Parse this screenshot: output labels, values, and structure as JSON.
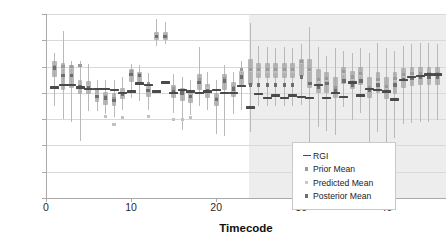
{
  "chart_data": {
    "type": "scatter",
    "title": "",
    "xlabel": "Timecode",
    "ylabel": "Ash (%)",
    "xlim": [
      0,
      47
    ],
    "ylim": [
      2,
      16
    ],
    "xticks": [
      0,
      10,
      20,
      30,
      40
    ],
    "yticks": [
      2,
      4,
      6,
      8,
      10,
      12,
      14,
      16
    ],
    "grid": true,
    "legend_position": "inside-bottom-right",
    "legend": [
      {
        "label": "RGI",
        "marker": "dash",
        "color": "#4a4a4a"
      },
      {
        "label": "Prior Mean",
        "marker": "square",
        "color": "#9a9a9a"
      },
      {
        "label": "Predicted Mean",
        "marker": "square",
        "color": "#c9c9c9"
      },
      {
        "label": "Posterior Mean",
        "marker": "square",
        "color": "#6e6e6e"
      }
    ],
    "annotations": [
      {
        "type": "shaded-region",
        "label": "forecast region",
        "x_start": 23.8,
        "x_end": 47,
        "color": "#e6e6e6"
      }
    ],
    "x": [
      1,
      2,
      3,
      4,
      5,
      6,
      7,
      8,
      9,
      10,
      11,
      12,
      13,
      14,
      15,
      16,
      17,
      18,
      19,
      20,
      21,
      22,
      23,
      24,
      25,
      26,
      27,
      28,
      29,
      30,
      31,
      32,
      33,
      34,
      35,
      36,
      37,
      38,
      39,
      40,
      41,
      42,
      43,
      44,
      45,
      46
    ],
    "series": [
      {
        "name": "RGI",
        "values": [
          10.4,
          10.6,
          10.6,
          10.4,
          10.3,
          10.3,
          10.3,
          10.2,
          10.0,
          10.1,
          10.7,
          10.6,
          10.1,
          10.8,
          10.0,
          10.2,
          10.1,
          10.0,
          10.1,
          10.2,
          10.0,
          10.0,
          10.5,
          8.9,
          9.9,
          9.6,
          9.8,
          9.6,
          9.8,
          9.7,
          9.6,
          10.6,
          9.6,
          10.0,
          9.7,
          10.8,
          9.8,
          10.3,
          10.2,
          10.1,
          9.5,
          11.0,
          11.2,
          11.3,
          11.4,
          11.4
        ]
      },
      {
        "name": "Prior Mean",
        "values": [
          12.0,
          12.0,
          12.0,
          12.1,
          10.4,
          9.7,
          9.7,
          9.6,
          9.9,
          11.6,
          11.4,
          10.7,
          14.3,
          14.3,
          10.3,
          10.0,
          9.7,
          11.0,
          10.2,
          9.6,
          11.1,
          10.4,
          11.8,
          11.8,
          11.8,
          11.8,
          11.8,
          11.8,
          11.8,
          12.4,
          11.8,
          11.0,
          11.1,
          10.4,
          11.6,
          11.2,
          11.5,
          10.4,
          11.0,
          10.5,
          11.1,
          11.4,
          11.5,
          11.5,
          11.5,
          11.5
        ]
      },
      {
        "name": "Predicted Mean",
        "values": [
          11.9,
          11.9,
          11.9,
          12.1,
          10.5,
          9.8,
          8.2,
          7.6,
          8.1,
          11.6,
          11.3,
          8.2,
          14.2,
          14.3,
          8.0,
          8.0,
          8.1,
          11.0,
          10.3,
          9.5,
          11.0,
          10.4,
          11.7,
          11.7,
          11.6,
          11.6,
          11.6,
          11.6,
          11.6,
          12.3,
          11.7,
          10.9,
          11.0,
          10.3,
          11.5,
          11.1,
          11.4,
          10.3,
          10.9,
          10.4,
          11.0,
          11.3,
          11.4,
          11.4,
          11.4,
          11.4
        ]
      },
      {
        "name": "Posterior Mean",
        "values": [
          11.9,
          11.3,
          11.3,
          10.5,
          10.4,
          9.7,
          9.6,
          9.4,
          9.9,
          11.4,
          11.3,
          10.2,
          14.3,
          14.3,
          10.1,
          10.0,
          9.7,
          10.8,
          10.2,
          9.5,
          10.9,
          10.3,
          11.2,
          10.6,
          10.6,
          10.6,
          10.6,
          10.6,
          10.6,
          11.2,
          10.7,
          10.4,
          10.7,
          10.2,
          10.9,
          10.6,
          10.9,
          10.2,
          10.6,
          10.1,
          10.6,
          11.0,
          11.1,
          11.2,
          11.2,
          11.2
        ]
      }
    ],
    "intervals": [
      {
        "x": 1,
        "low": 9.0,
        "high": 13.0,
        "q1": 11.2,
        "q3": 12.4
      },
      {
        "x": 2,
        "low": 8.0,
        "high": 14.7,
        "q1": 10.2,
        "q3": 12.3
      },
      {
        "x": 3,
        "low": 7.8,
        "high": 12.4,
        "q1": 10.4,
        "q3": 12.1
      },
      {
        "x": 4,
        "low": 6.3,
        "high": 12.4,
        "q1": 9.9,
        "q3": 11.0
      },
      {
        "x": 5,
        "low": 8.6,
        "high": 12.2,
        "q1": 9.9,
        "q3": 10.9
      },
      {
        "x": 6,
        "low": 8.6,
        "high": 11.0,
        "q1": 9.3,
        "q3": 10.3
      },
      {
        "x": 7,
        "low": 8.4,
        "high": 11.0,
        "q1": 9.1,
        "q3": 10.1
      },
      {
        "x": 8,
        "low": 8.2,
        "high": 11.0,
        "q1": 9.0,
        "q3": 10.0
      },
      {
        "x": 9,
        "low": 8.7,
        "high": 11.2,
        "q1": 9.5,
        "q3": 10.4
      },
      {
        "x": 10,
        "low": 9.6,
        "high": 12.2,
        "q1": 10.8,
        "q3": 11.8
      },
      {
        "x": 11,
        "low": 9.4,
        "high": 12.1,
        "q1": 10.7,
        "q3": 11.6
      },
      {
        "x": 12,
        "low": 8.7,
        "high": 11.5,
        "q1": 9.7,
        "q3": 10.7
      },
      {
        "x": 13,
        "low": 13.6,
        "high": 15.6,
        "q1": 14.0,
        "q3": 14.6
      },
      {
        "x": 14,
        "low": 13.7,
        "high": 15.4,
        "q1": 14.0,
        "q3": 14.6
      },
      {
        "x": 15,
        "low": 8.5,
        "high": 11.4,
        "q1": 9.6,
        "q3": 10.6
      },
      {
        "x": 16,
        "low": 7.2,
        "high": 11.2,
        "q1": 9.4,
        "q3": 10.4
      },
      {
        "x": 17,
        "low": 8.3,
        "high": 11.0,
        "q1": 9.2,
        "q3": 10.1
      },
      {
        "x": 18,
        "low": 9.0,
        "high": 13.5,
        "q1": 10.2,
        "q3": 11.4
      },
      {
        "x": 19,
        "low": 8.7,
        "high": 11.6,
        "q1": 9.6,
        "q3": 10.7
      },
      {
        "x": 20,
        "low": 6.9,
        "high": 11.0,
        "q1": 9.0,
        "q3": 10.0
      },
      {
        "x": 21,
        "low": 6.7,
        "high": 12.1,
        "q1": 10.2,
        "q3": 11.4
      },
      {
        "x": 22,
        "low": 8.4,
        "high": 11.6,
        "q1": 9.7,
        "q3": 10.8
      },
      {
        "x": 23,
        "low": 8.7,
        "high": 12.4,
        "q1": 10.6,
        "q3": 11.7
      },
      {
        "x": 24,
        "low": 7.0,
        "high": 15.3,
        "q1": 10.6,
        "q3": 12.6
      },
      {
        "x": 25,
        "low": 9.0,
        "high": 13.6,
        "q1": 11.1,
        "q3": 12.3
      },
      {
        "x": 26,
        "low": 9.0,
        "high": 13.5,
        "q1": 11.1,
        "q3": 12.3
      },
      {
        "x": 27,
        "low": 9.0,
        "high": 13.4,
        "q1": 11.1,
        "q3": 12.3
      },
      {
        "x": 28,
        "low": 9.0,
        "high": 13.5,
        "q1": 11.1,
        "q3": 12.3
      },
      {
        "x": 29,
        "low": 9.0,
        "high": 13.4,
        "q1": 11.1,
        "q3": 12.3
      },
      {
        "x": 30,
        "low": 9.1,
        "high": 13.7,
        "q1": 11.3,
        "q3": 12.6
      },
      {
        "x": 31,
        "low": 5.8,
        "high": 15.0,
        "q1": 10.4,
        "q3": 12.6
      },
      {
        "x": 32,
        "low": 7.4,
        "high": 13.5,
        "q1": 10.0,
        "q3": 11.8
      },
      {
        "x": 33,
        "low": 7.1,
        "high": 12.8,
        "q1": 10.0,
        "q3": 11.6
      },
      {
        "x": 34,
        "low": 6.8,
        "high": 13.4,
        "q1": 9.6,
        "q3": 11.2
      },
      {
        "x": 35,
        "low": 8.9,
        "high": 13.2,
        "q1": 10.7,
        "q3": 12.0
      },
      {
        "x": 36,
        "low": 7.9,
        "high": 13.0,
        "q1": 10.3,
        "q3": 11.7
      },
      {
        "x": 37,
        "low": 8.5,
        "high": 13.4,
        "q1": 10.6,
        "q3": 12.0
      },
      {
        "x": 38,
        "low": 6.2,
        "high": 13.0,
        "q1": 9.6,
        "q3": 11.2
      },
      {
        "x": 39,
        "low": 7.0,
        "high": 13.8,
        "q1": 10.0,
        "q3": 11.6
      },
      {
        "x": 40,
        "low": 6.0,
        "high": 13.4,
        "q1": 9.5,
        "q3": 11.2
      },
      {
        "x": 41,
        "low": 6.6,
        "high": 13.2,
        "q1": 9.9,
        "q3": 11.6
      },
      {
        "x": 42,
        "low": 7.6,
        "high": 13.6,
        "q1": 10.4,
        "q3": 11.9
      },
      {
        "x": 43,
        "low": 7.7,
        "high": 13.7,
        "q1": 10.5,
        "q3": 12.0
      },
      {
        "x": 44,
        "low": 7.8,
        "high": 13.8,
        "q1": 10.6,
        "q3": 12.0
      },
      {
        "x": 45,
        "low": 7.8,
        "high": 13.8,
        "q1": 10.6,
        "q3": 12.0
      },
      {
        "x": 46,
        "low": 7.9,
        "high": 13.7,
        "q1": 10.6,
        "q3": 12.0
      }
    ]
  }
}
